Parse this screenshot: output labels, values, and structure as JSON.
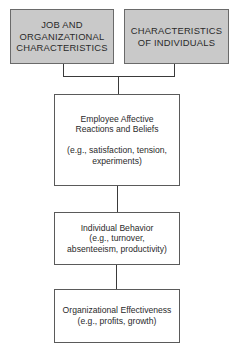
{
  "diagram": {
    "type": "flowchart",
    "inputs": [
      {
        "id": "job-org",
        "lines": [
          "JOB AND",
          "ORGANIZATIONAL",
          "CHARACTERISTICS"
        ]
      },
      {
        "id": "individuals",
        "lines": [
          "CHARACTERISTICS",
          "OF INDIVIDUALS"
        ]
      }
    ],
    "stages": [
      {
        "title_lines": [
          "Employee Affective",
          "Reactions and Beliefs"
        ],
        "example_lines": [
          "(e.g., satisfaction, tension,",
          "experiments)"
        ]
      },
      {
        "title_lines": [
          "Individual Behavior"
        ],
        "example_lines": [
          "(e.g., turnover,",
          "absenteeism, productivity)"
        ]
      },
      {
        "title_lines": [
          "Organizational Effectiveness"
        ],
        "example_lines": [
          "(e.g., profits, growth)"
        ]
      }
    ],
    "colors": {
      "input_fill": "#c9c9c9",
      "stage_fill": "#ffffff",
      "line": "#3a3a3a"
    }
  }
}
